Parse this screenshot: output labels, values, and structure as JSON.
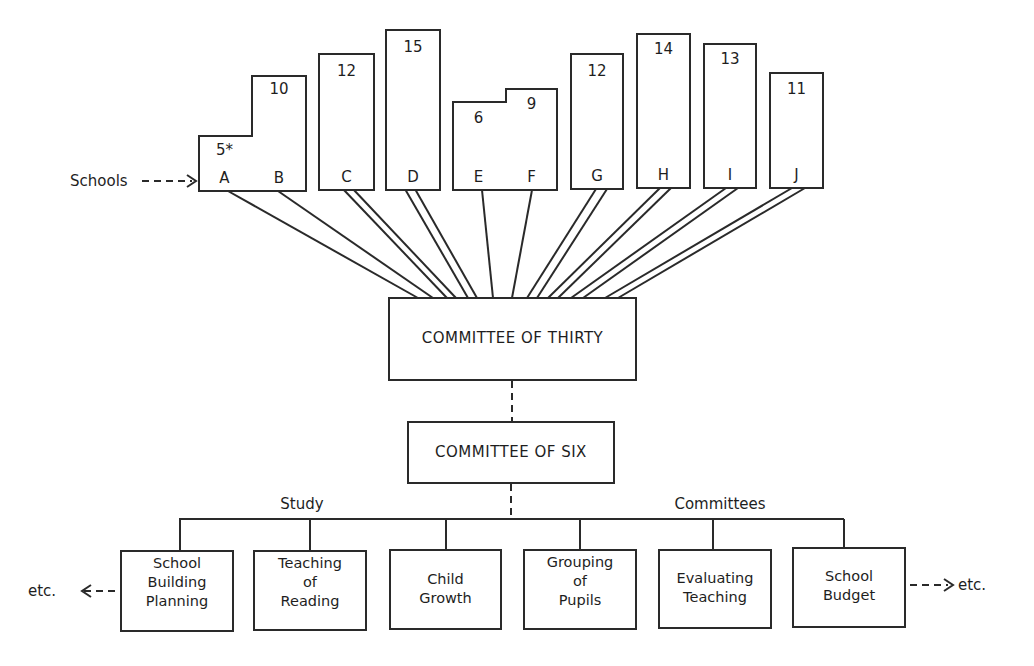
{
  "diagram": {
    "schools_label": "Schools",
    "schools": [
      {
        "id": "A",
        "count": "5*",
        "lines": 1
      },
      {
        "id": "B",
        "count": "10",
        "lines": 1
      },
      {
        "id": "C",
        "count": "12",
        "lines": 2
      },
      {
        "id": "D",
        "count": "15",
        "lines": 2
      },
      {
        "id": "E",
        "count": "6",
        "lines": 1
      },
      {
        "id": "F",
        "count": "9",
        "lines": 1
      },
      {
        "id": "G",
        "count": "12",
        "lines": 2
      },
      {
        "id": "H",
        "count": "14",
        "lines": 2
      },
      {
        "id": "I",
        "count": "13",
        "lines": 2
      },
      {
        "id": "J",
        "count": "11",
        "lines": 2
      }
    ],
    "committee_thirty": "COMMITTEE OF THIRTY",
    "committee_six": "COMMITTEE OF SIX",
    "study_label": "Study",
    "committees_label": "Committees",
    "study_committees": [
      {
        "line1": "School",
        "line2": "Building",
        "line3": "Planning"
      },
      {
        "line1": "Teaching",
        "line2": "of",
        "line3": "Reading"
      },
      {
        "line1": "Child",
        "line2": "Growth",
        "line3": ""
      },
      {
        "line1": "Grouping",
        "line2": "of",
        "line3": "Pupils"
      },
      {
        "line1": "Evaluating",
        "line2": "Teaching",
        "line3": ""
      },
      {
        "line1": "School",
        "line2": "Budget",
        "line3": ""
      }
    ],
    "etc_left": "etc.",
    "etc_right": "etc."
  }
}
